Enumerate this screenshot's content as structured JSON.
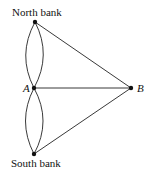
{
  "diagram": {
    "nodes": [
      {
        "id": "north",
        "label": "North bank",
        "x": 35,
        "y": 22
      },
      {
        "id": "A",
        "label": "A",
        "x": 34,
        "y": 88
      },
      {
        "id": "B",
        "label": "B",
        "x": 131,
        "y": 88
      },
      {
        "id": "south",
        "label": "South bank",
        "x": 34,
        "y": 154
      }
    ],
    "edges": [
      {
        "from": "north",
        "to": "A",
        "count": 2,
        "style": "curved"
      },
      {
        "from": "south",
        "to": "A",
        "count": 2,
        "style": "curved"
      },
      {
        "from": "north",
        "to": "B",
        "count": 1,
        "style": "straight"
      },
      {
        "from": "A",
        "to": "B",
        "count": 1,
        "style": "straight"
      },
      {
        "from": "south",
        "to": "B",
        "count": 1,
        "style": "straight"
      }
    ]
  },
  "labels": {
    "north": "North bank",
    "south": "South bank",
    "a": "A",
    "b": "B"
  }
}
